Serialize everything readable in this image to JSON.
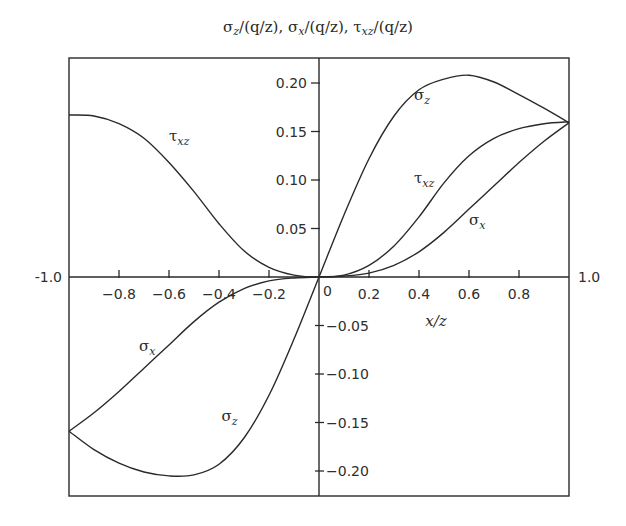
{
  "chart_data": {
    "type": "line",
    "title": "σz/(q/z), σx/(q/z), τxz/(q/z)",
    "xlabel": "x/z",
    "ylabel": "",
    "xlim": [
      -1.0,
      1.0
    ],
    "ylim": [
      -0.225,
      0.225
    ],
    "grid": false,
    "legend": "inline curve labels",
    "x_axis_end_labels": [
      "-1.0",
      "1.0"
    ],
    "x_ticks": [
      "-0.8",
      "-0.6",
      "-0.4",
      "-0.2",
      "0",
      "0.2",
      "0.4",
      "0.6",
      "0.8"
    ],
    "y_ticks_positive": [
      "0.05",
      "0.10",
      "0.15",
      "0.20"
    ],
    "y_ticks_negative": [
      "-0.05",
      "-0.10",
      "-0.15",
      "-0.20"
    ],
    "x": [
      -1.0,
      -0.9,
      -0.8,
      -0.7,
      -0.6,
      -0.5,
      -0.4,
      -0.3,
      -0.2,
      -0.1,
      0.0,
      0.1,
      0.2,
      0.3,
      0.4,
      0.5,
      0.6,
      0.7,
      0.8,
      0.9,
      1.0
    ],
    "series": [
      {
        "name": "σz",
        "label": "σ",
        "subscript": "z",
        "values": [
          -0.159,
          -0.178,
          -0.192,
          -0.201,
          -0.205,
          -0.204,
          -0.193,
          -0.166,
          -0.122,
          -0.064,
          0.0,
          0.064,
          0.122,
          0.166,
          0.193,
          0.204,
          0.208,
          0.201,
          0.188,
          0.174,
          0.159
        ]
      },
      {
        "name": "σx",
        "label": "σ",
        "subscript": "x",
        "values": [
          -0.159,
          -0.14,
          -0.118,
          -0.094,
          -0.07,
          -0.046,
          -0.026,
          -0.012,
          -0.004,
          -0.001,
          0.0,
          0.001,
          0.004,
          0.012,
          0.026,
          0.046,
          0.07,
          0.094,
          0.118,
          0.14,
          0.159
        ]
      },
      {
        "name": "τxz",
        "label": "τ",
        "subscript": "xz",
        "values": [
          0.167,
          0.166,
          0.158,
          0.143,
          0.118,
          0.088,
          0.055,
          0.027,
          0.01,
          0.002,
          0.0,
          0.002,
          0.012,
          0.032,
          0.062,
          0.097,
          0.125,
          0.143,
          0.153,
          0.158,
          0.16
        ]
      }
    ],
    "annotations": [
      {
        "text": "σ",
        "sub": "z",
        "x": 0.38,
        "y": 0.182
      },
      {
        "text": "τ",
        "sub": "xz",
        "x": 0.38,
        "y": 0.097
      },
      {
        "text": "σ",
        "sub": "x",
        "x": 0.6,
        "y": 0.054
      },
      {
        "text": "τ",
        "sub": "xz",
        "x": -0.6,
        "y": 0.14
      },
      {
        "text": "σ",
        "sub": "x",
        "x": -0.72,
        "y": -0.076
      },
      {
        "text": "σ",
        "sub": "z",
        "x": -0.39,
        "y": -0.148
      }
    ]
  },
  "labels": {
    "title": "σz/(q/z), σx/(q/z), τxz/(q/z)",
    "title_parts": [
      "σ",
      "z",
      "/(q/z), ",
      "σ",
      "x",
      "/(q/z), ",
      "τ",
      "xz",
      "/(q/z)"
    ],
    "x_axis_title": "x/z",
    "x_left_end": "-1.0",
    "x_right_end": "1.0",
    "x_origin": "0"
  },
  "colors": {
    "ink": "#2a2a2a",
    "background": "#ffffff"
  }
}
